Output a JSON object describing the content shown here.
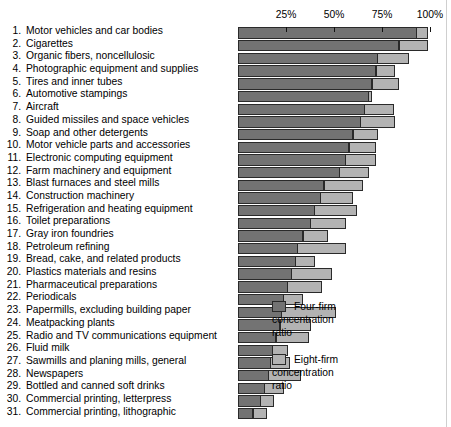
{
  "chart_data": {
    "type": "bar",
    "orientation": "horizontal",
    "title": "",
    "xlabel": "",
    "ylabel": "",
    "xlim": [
      0,
      100
    ],
    "x_tick_labels": [
      "25%",
      "50%",
      "75%",
      "100%"
    ],
    "x_ticks": [
      25,
      50,
      75,
      100
    ],
    "grid": false,
    "legend_position": "right",
    "categories": [
      "Motor vehicles and car bodies",
      "Cigarettes",
      "Organic fibers, noncellulosic",
      "Photographic equipment and supplies",
      "Tires and inner tubes",
      "Automotive stampings",
      "Aircraft",
      "Guided missiles and space vehicles",
      "Soap and other detergents",
      "Motor vehicle parts and accessories",
      "Electronic computing equipment",
      "Farm machinery and equipment",
      "Blast furnaces and steel mills",
      "Construction machinery",
      "Refrigeration and heating equipment",
      "Toilet preparations",
      "Gray iron foundries",
      "Petroleum refining",
      "Bread, cake, and related products",
      "Plastics materials and resins",
      "Pharmaceutical preparations",
      "Periodicals",
      "Papermills, excluding building paper",
      "Meatpacking plants",
      "Radio and TV communications equipment",
      "Fluid milk",
      "Sawmills and planing mills, general",
      "Newspapers",
      "Bottled and canned soft drinks",
      "Commercial printing, letterpress",
      "Commercial printing, lithographic"
    ],
    "series": [
      {
        "name": "Four-firm concentration ratio",
        "color": "#737373",
        "values": [
          93,
          84,
          73,
          72,
          70,
          68,
          66,
          64,
          60,
          58,
          56,
          53,
          45,
          43,
          40,
          38,
          34,
          31,
          30,
          28,
          26,
          24,
          23,
          22,
          20,
          18,
          17,
          16,
          14,
          12,
          8
        ]
      },
      {
        "name": "Eight-firm concentration ratio",
        "color": "#b3b3b3",
        "values": [
          99,
          99,
          89,
          82,
          84,
          70,
          81,
          82,
          73,
          72,
          72,
          68,
          65,
          60,
          62,
          56,
          47,
          56,
          40,
          49,
          44,
          34,
          51,
          38,
          37,
          26,
          27,
          33,
          24,
          19,
          15
        ]
      }
    ],
    "value_unit": "%"
  },
  "labels": {
    "numbers": [
      "1.",
      "2.",
      "3.",
      "4.",
      "5.",
      "6.",
      "7.",
      "8.",
      "9.",
      "10.",
      "11.",
      "12.",
      "13.",
      "14.",
      "15.",
      "16.",
      "17.",
      "18.",
      "19.",
      "20.",
      "21.",
      "22.",
      "23.",
      "24.",
      "25.",
      "26.",
      "27.",
      "28.",
      "29.",
      "30.",
      "31."
    ]
  },
  "legend": {
    "items": [
      {
        "label": "Four-firm\nconcentration\nratio",
        "swatch": "four"
      },
      {
        "label": "Eight-firm\nconcentration\nratio",
        "swatch": "eight"
      }
    ]
  },
  "colors": {
    "four_firm": "#737373",
    "eight_firm": "#b3b3b3",
    "bar_outline": "#2a2a2a",
    "background": "#ffffff",
    "text": "#000000"
  }
}
